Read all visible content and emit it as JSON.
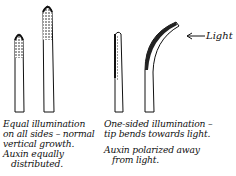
{
  "diagram": {
    "type": "plant phototropism illustration",
    "panels": [
      {
        "id": "equal-illumination",
        "caption_lines": [
          "Equal illumination",
          "on all sides – normal",
          "vertical growth.",
          "Auxin equally",
          "distributed."
        ],
        "shoots": [
          "short straight shoot",
          "tall straight shoot"
        ]
      },
      {
        "id": "one-sided-illumination",
        "caption_lines": [
          "One-sided illumination –",
          "tip bends towards light.",
          "Auxin polarized away",
          "from light."
        ],
        "shoots": [
          "straight shoot shaded on left",
          "shoot bending right toward light"
        ]
      }
    ],
    "light_label": "Light",
    "arrow_direction": "left"
  }
}
